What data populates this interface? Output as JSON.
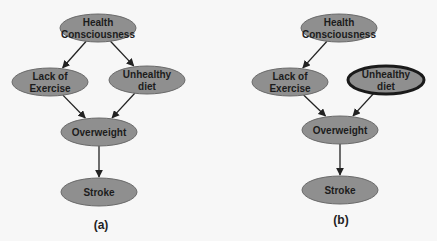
{
  "diagrams": [
    {
      "id": "a",
      "caption": "(a)",
      "nodes": [
        {
          "id": "health",
          "lines": [
            "Health",
            "Consciousness"
          ],
          "highlighted": false
        },
        {
          "id": "exercise",
          "lines": [
            "Lack of",
            "Exercise"
          ],
          "highlighted": false
        },
        {
          "id": "diet",
          "lines": [
            "Unhealthy",
            "diet"
          ],
          "highlighted": false
        },
        {
          "id": "overweight",
          "lines": [
            "Overweight"
          ],
          "highlighted": false
        },
        {
          "id": "stroke",
          "lines": [
            "Stroke"
          ],
          "highlighted": false
        }
      ],
      "edges": [
        {
          "from": "health",
          "to": "exercise"
        },
        {
          "from": "health",
          "to": "diet"
        },
        {
          "from": "exercise",
          "to": "overweight"
        },
        {
          "from": "diet",
          "to": "overweight"
        },
        {
          "from": "overweight",
          "to": "stroke"
        }
      ]
    },
    {
      "id": "b",
      "caption": "(b)",
      "nodes": [
        {
          "id": "health",
          "lines": [
            "Health",
            "Consciousness"
          ],
          "highlighted": false
        },
        {
          "id": "exercise",
          "lines": [
            "Lack of",
            "Exercise"
          ],
          "highlighted": false
        },
        {
          "id": "diet",
          "lines": [
            "Unhealthy",
            "diet"
          ],
          "highlighted": true
        },
        {
          "id": "overweight",
          "lines": [
            "Overweight"
          ],
          "highlighted": false
        },
        {
          "id": "stroke",
          "lines": [
            "Stroke"
          ],
          "highlighted": false
        }
      ],
      "edges": [
        {
          "from": "health",
          "to": "exercise"
        },
        {
          "from": "exercise",
          "to": "overweight"
        },
        {
          "from": "diet",
          "to": "overweight"
        },
        {
          "from": "overweight",
          "to": "stroke"
        }
      ]
    }
  ],
  "colors": {
    "node_fill": "#8f8f8f",
    "node_text": "#1c1c1c",
    "edge": "#222222",
    "highlight_border": "#1a1a1a",
    "background": "#f7f7f7"
  }
}
